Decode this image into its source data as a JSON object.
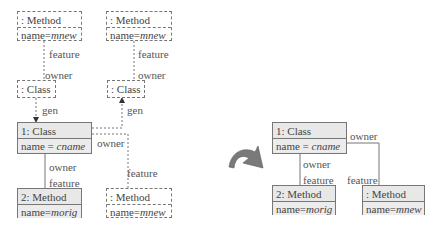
{
  "left": {
    "top_method_a": {
      "title": ": Method",
      "attr_key": "name=",
      "attr_val": "mnew"
    },
    "top_method_b": {
      "title": ": Method",
      "attr_key": "name=",
      "attr_val": "mnew"
    },
    "class_a": {
      "title": ": Class"
    },
    "class_b": {
      "title": ": Class"
    },
    "class_1": {
      "title": "1: Class",
      "attr_key": "name = ",
      "attr_val": "cname"
    },
    "method_2": {
      "title": "2: Method",
      "attr_key": "name=",
      "attr_val": "morig"
    },
    "method_new": {
      "title": ": Method",
      "attr_key": "name=",
      "attr_val": "mnew"
    },
    "labels": {
      "feature_a": "feature",
      "owner_a": "owner",
      "gen_a": "gen",
      "feature_b": "feature",
      "owner_b": "owner",
      "gen_b": "gen",
      "owner_c": "owner",
      "feature_c": "feature",
      "owner_d": "owner",
      "feature_d": "feature"
    }
  },
  "right": {
    "class_1": {
      "title": "1: Class",
      "attr_key": "name = ",
      "attr_val": "cname"
    },
    "method_2": {
      "title": "2: Method",
      "attr_key": "name=",
      "attr_val": "morig"
    },
    "method_new": {
      "title": ": Method",
      "attr_key": "name=",
      "attr_val": "mnew"
    },
    "labels": {
      "owner_top": "owner",
      "owner_left": "owner",
      "feature_left": "feature",
      "feature_right": "feature"
    }
  },
  "transform_arrow": {
    "icon": "curved-arrow-icon",
    "color": "#7a7a7a"
  }
}
